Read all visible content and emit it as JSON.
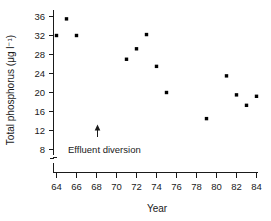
{
  "chart_data": {
    "type": "scatter",
    "title": "",
    "xlabel": "Year",
    "ylabel": "Total phosphorus (μg l⁻¹)",
    "xlim": [
      63,
      84.8
    ],
    "ylim": [
      6.5,
      37.5
    ],
    "xticks": [
      64,
      66,
      68,
      70,
      72,
      74,
      76,
      78,
      80,
      82,
      84
    ],
    "xtick_labels": [
      "64",
      "66",
      "68",
      "70",
      "72",
      "74",
      "76",
      "78",
      "80",
      "82",
      "84"
    ],
    "xminor_ticks": [
      65,
      67,
      69,
      71,
      73,
      75,
      77,
      79,
      81,
      83
    ],
    "yticks": [
      8,
      12,
      16,
      20,
      24,
      28,
      32,
      36
    ],
    "ytick_labels": [
      "8",
      "12",
      "16",
      "20",
      "24",
      "28",
      "32",
      "36"
    ],
    "grid": false,
    "legend": null,
    "axis_break": true,
    "marker": "filled-square",
    "marker_color": "#000000",
    "x": [
      64,
      65,
      66,
      71,
      72,
      73,
      74,
      75,
      79,
      81,
      82,
      83,
      84
    ],
    "y": [
      32.0,
      35.5,
      32.0,
      27.0,
      29.2,
      32.2,
      25.5,
      20.0,
      14.5,
      23.5,
      19.5,
      17.3,
      19.2
    ],
    "points": [
      {
        "x": 64,
        "y": 32.0
      },
      {
        "x": 65,
        "y": 35.5
      },
      {
        "x": 66,
        "y": 32.0
      },
      {
        "x": 71,
        "y": 27.0
      },
      {
        "x": 72,
        "y": 29.2
      },
      {
        "x": 73,
        "y": 32.2
      },
      {
        "x": 74,
        "y": 25.5
      },
      {
        "x": 75,
        "y": 20.0
      },
      {
        "x": 79,
        "y": 14.5
      },
      {
        "x": 81,
        "y": 23.5
      },
      {
        "x": 82,
        "y": 19.5
      },
      {
        "x": 83,
        "y": 17.3
      },
      {
        "x": 84,
        "y": 19.2
      }
    ],
    "annotations": [
      {
        "text": "Effluent diversion",
        "arrow_x": 68.1,
        "arrow_y_tail": 11.2,
        "arrow_y_head": 13.4,
        "label_x": 70.4,
        "label_y": 9.0
      }
    ]
  }
}
